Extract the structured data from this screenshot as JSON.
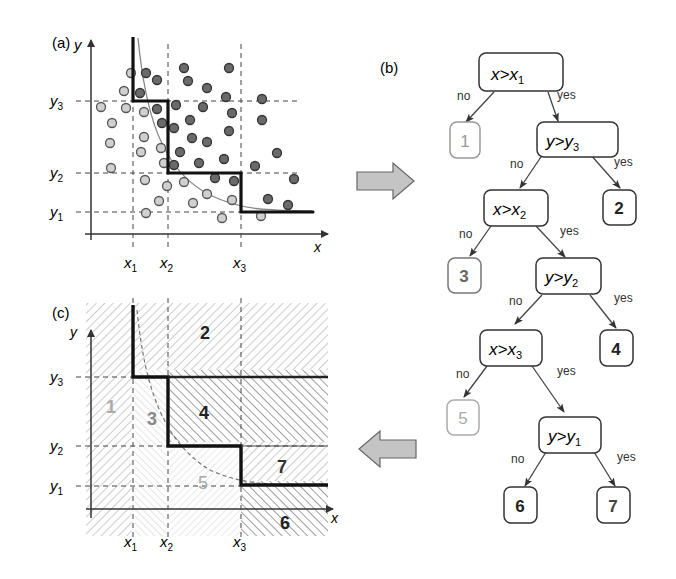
{
  "panels": {
    "a": {
      "label": "(a)",
      "axis_x": "x",
      "axis_y": "y",
      "x_ticks": [
        {
          "name": "x",
          "sub": "1"
        },
        {
          "name": "x",
          "sub": "2"
        },
        {
          "name": "x",
          "sub": "3"
        }
      ],
      "y_ticks": [
        {
          "name": "y",
          "sub": "3"
        },
        {
          "name": "y",
          "sub": "2"
        },
        {
          "name": "y",
          "sub": "1"
        }
      ]
    },
    "b": {
      "label": "(b)",
      "nodes": [
        {
          "id": "n1",
          "var": "x",
          "op": ">",
          "thr": "x",
          "sub": "1"
        },
        {
          "id": "n2",
          "var": "y",
          "op": ">",
          "thr": "y",
          "sub": "3"
        },
        {
          "id": "n3",
          "var": "x",
          "op": ">",
          "thr": "x",
          "sub": "2"
        },
        {
          "id": "n4",
          "var": "y",
          "op": ">",
          "thr": "y",
          "sub": "2"
        },
        {
          "id": "n5",
          "var": "x",
          "op": ">",
          "thr": "x",
          "sub": "3"
        },
        {
          "id": "n6",
          "var": "y",
          "op": ">",
          "thr": "y",
          "sub": "1"
        }
      ],
      "leaves": [
        "1",
        "2",
        "3",
        "4",
        "5",
        "6",
        "7"
      ],
      "edge_no": "no",
      "edge_yes": "yes"
    },
    "c": {
      "label": "(c)",
      "axis_x": "x",
      "axis_y": "y",
      "regions": [
        "1",
        "2",
        "3",
        "4",
        "5",
        "6",
        "7"
      ]
    }
  },
  "arrows": {
    "right": "arrow-right",
    "left": "arrow-left"
  }
}
